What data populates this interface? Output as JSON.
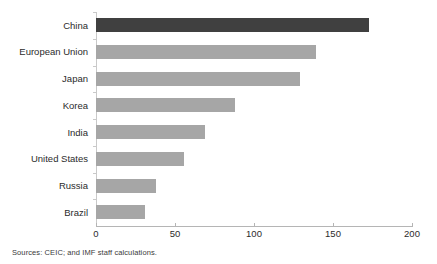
{
  "chart_data": {
    "type": "bar",
    "orientation": "horizontal",
    "title": "",
    "subtitle": "",
    "xlabel": "",
    "ylabel": "",
    "xlim": [
      0,
      200
    ],
    "xticks": [
      0,
      50,
      100,
      150,
      200
    ],
    "xtick_labels": [
      "0",
      "50",
      "100",
      "150",
      "200"
    ],
    "grid": false,
    "legend": null,
    "categories": [
      "China",
      "European Union",
      "Japan",
      "Korea",
      "India",
      "United States",
      "Russia",
      "Brazil"
    ],
    "values": [
      173,
      139,
      129,
      88,
      69,
      56,
      38,
      31
    ],
    "bar_colors": [
      "#404040",
      "#a6a6a6",
      "#a6a6a6",
      "#a6a6a6",
      "#a6a6a6",
      "#a6a6a6",
      "#a6a6a6",
      "#a6a6a6"
    ],
    "highlight_category": "China",
    "annotations": []
  },
  "colors": {
    "bar_default": "#a6a6a6",
    "bar_highlight": "#404040",
    "axis_line": "#b5b5b5",
    "category_axis_line": "#c9c9c9",
    "text": "#2b2b2b",
    "background": "#ffffff"
  },
  "footer": {
    "source_note": "Sources: CEIC; and IMF staff calculations."
  }
}
